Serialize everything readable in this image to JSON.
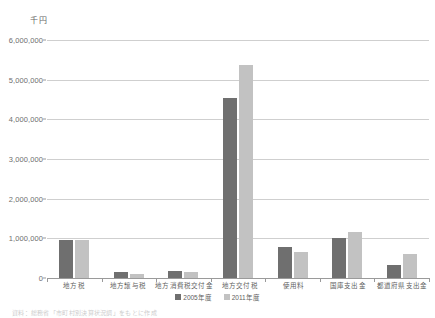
{
  "chart_data": {
    "type": "bar",
    "title": "",
    "subtitle": "",
    "xlabel": "",
    "ylabel": "千円",
    "ylim": [
      0,
      6000000
    ],
    "ytick_values": [
      6000000,
      5000000,
      4000000,
      3000000,
      2000000,
      1000000,
      0
    ],
    "ytick_labels": [
      "6,000,000",
      "5,000,000",
      "4,000,000",
      "3,000,000",
      "2,000,000",
      "1,000,000",
      "0"
    ],
    "grid": true,
    "legend_position": "bottom-center",
    "categories": [
      "地方税",
      "地方譲与税",
      "地方消費税交付金",
      "地方交付税",
      "使用料",
      "国庫支出金",
      "都道府県支出金"
    ],
    "series": [
      {
        "name": "2005年度",
        "color": "#6f6f6f",
        "values": [
          950000,
          150000,
          180000,
          4530000,
          790000,
          1010000,
          330000
        ]
      },
      {
        "name": "2011年度",
        "color": "#c2c2c2",
        "values": [
          950000,
          110000,
          160000,
          5360000,
          650000,
          1150000,
          610000
        ]
      }
    ]
  },
  "footnote": "資料：総務省「市町村別決算状況調」をもとに作成",
  "colors": {
    "series_0": "#6f6f6f",
    "series_1": "#c2c2c2",
    "gridline": "#cfcfcf",
    "axis": "#9a9a9a",
    "text": "#5e5e5e"
  }
}
